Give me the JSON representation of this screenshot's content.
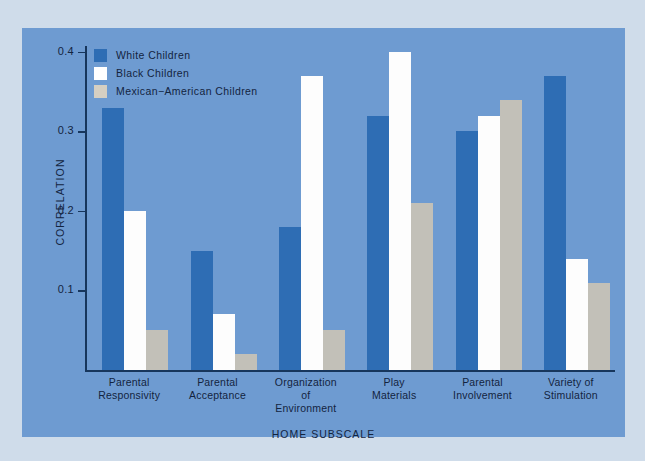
{
  "chart_data": {
    "type": "bar",
    "title": "",
    "xlabel": "HOME SUBSCALE",
    "ylabel": "CORRELATION",
    "categories": [
      "Parental\nResponsivity",
      "Parental\nAcceptance",
      "Organization\nof\nEnvironment",
      "Play\nMaterials",
      "Parental\nInvolvement",
      "Variety of\nStimulation"
    ],
    "category_lines": [
      [
        "Parental",
        "Responsivity"
      ],
      [
        "Parental",
        "Acceptance"
      ],
      [
        "Organization",
        "of",
        "Environment"
      ],
      [
        "Play",
        "Materials"
      ],
      [
        "Parental",
        "Involvement"
      ],
      [
        "Variety of",
        "Stimulation"
      ]
    ],
    "series": [
      {
        "name": "White Children",
        "color": "#2e6db4",
        "values": [
          0.33,
          0.15,
          0.18,
          0.32,
          0.3,
          0.37
        ]
      },
      {
        "name": "Black Children",
        "color": "#ffffff",
        "values": [
          0.2,
          0.07,
          0.37,
          0.4,
          0.32,
          0.14
        ]
      },
      {
        "name": "Mexican-American Children",
        "color": "#c2c0b8",
        "values": [
          0.05,
          0.02,
          0.05,
          0.21,
          0.34,
          0.11
        ]
      }
    ],
    "ylim": [
      0.0,
      0.43
    ],
    "yticks": [
      0.1,
      0.2,
      0.3,
      0.4
    ],
    "ytick_labels": [
      "0.1",
      "0.2",
      "0.3",
      "0.4"
    ],
    "grid": false,
    "legend_position": "top-left"
  },
  "legend": {
    "items": [
      {
        "label": "White Children"
      },
      {
        "label": "Black Children"
      },
      {
        "label": "Mexican−American Children"
      }
    ]
  },
  "colors": {
    "panel_background": "#6e9bd1",
    "page_background": "#cfdcea",
    "axis": "#17365c",
    "text": "#13243f",
    "series_white_children": "#2e6db4",
    "series_black_children": "#ffffff",
    "series_mexican_american_children": "#c2c0b8"
  }
}
